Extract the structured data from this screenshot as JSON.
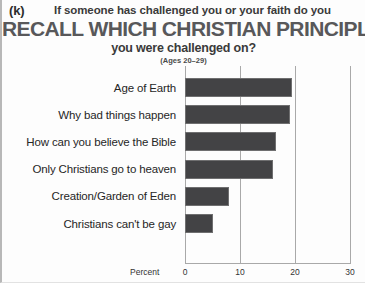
{
  "panel": {
    "letter": "(k)"
  },
  "title": {
    "kicker": "If someone has challenged you or your faith do you",
    "main": "RECALL WHICH CHRISTIAN PRINCIPLE",
    "tail": "you were challenged on?",
    "subtitle": "(Ages 20–29)"
  },
  "axis": {
    "x_title": "Percent",
    "ticks": [
      "0",
      "10",
      "20",
      "30"
    ]
  },
  "colors": {
    "bar_fill": "#434345",
    "bar_stroke": "#6f6f70",
    "gridline": "#a9a9a9",
    "title_main": "#58585a",
    "text": "#262626"
  },
  "chart_data": {
    "type": "bar",
    "orientation": "horizontal",
    "title": "RECALL WHICH CHRISTIAN PRINCIPLE",
    "subtitle": "(Ages 20–29)",
    "xlabel": "Percent",
    "ylabel": "",
    "xlim": [
      0,
      30
    ],
    "xticks": [
      0,
      10,
      20,
      30
    ],
    "grid": true,
    "legend": "none",
    "categories": [
      "Age of Earth",
      "Why bad things happen",
      "How can you believe the Bible",
      "Only Christians go to heaven",
      "Creation/Garden of Eden",
      "Christians can't be gay"
    ],
    "values": [
      19.5,
      19,
      16.5,
      16,
      8,
      5
    ]
  }
}
